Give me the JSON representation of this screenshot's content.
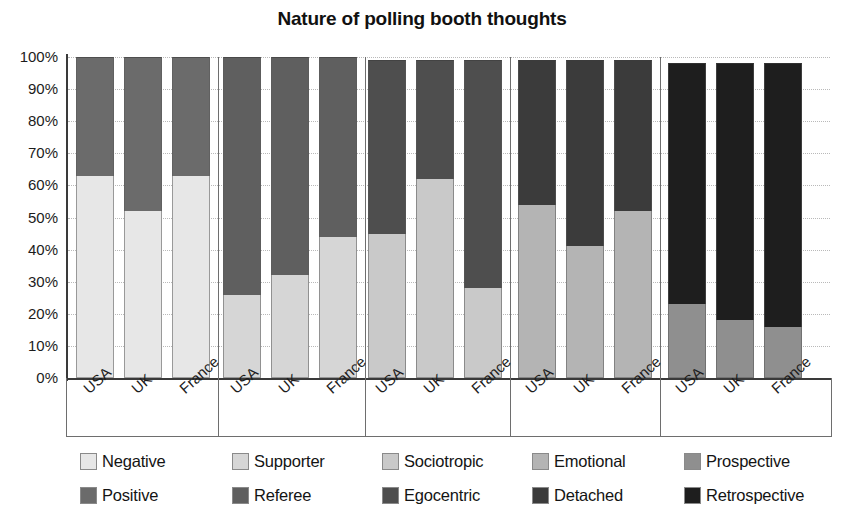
{
  "chart_data": {
    "type": "bar",
    "subtype": "stacked-100-percent-grouped",
    "title": "Nature of polling booth thoughts",
    "xlabel": "",
    "ylabel": "",
    "ylim": [
      0,
      100
    ],
    "ytick_labels": [
      "100%",
      "90%",
      "80%",
      "70%",
      "60%",
      "50%",
      "40%",
      "30%",
      "20%",
      "10%",
      "0%"
    ],
    "ytick_values": [
      100,
      90,
      80,
      70,
      60,
      50,
      40,
      30,
      20,
      10,
      0
    ],
    "grid": true,
    "grid_style": "dotted-horizontal",
    "legend_position": "bottom",
    "categories": [
      "USA",
      "UK",
      "France"
    ],
    "groups": [
      {
        "name": "Negative / Positive",
        "bottom_series": "Negative",
        "top_series": "Positive",
        "bottom_color": "#e7e7e7",
        "top_color": "#6b6b6b",
        "bars": [
          {
            "category": "USA",
            "bottom": 63,
            "top": 37,
            "total": 100
          },
          {
            "category": "UK",
            "bottom": 52,
            "top": 48,
            "total": 100
          },
          {
            "category": "France",
            "bottom": 63,
            "top": 37,
            "total": 100
          }
        ]
      },
      {
        "name": "Supporter / Referee",
        "bottom_series": "Supporter",
        "top_series": "Referee",
        "bottom_color": "#d6d6d6",
        "top_color": "#5f5f5f",
        "bars": [
          {
            "category": "USA",
            "bottom": 26,
            "top": 74,
            "total": 100
          },
          {
            "category": "UK",
            "bottom": 32,
            "top": 68,
            "total": 100
          },
          {
            "category": "France",
            "bottom": 44,
            "top": 56,
            "total": 100
          }
        ]
      },
      {
        "name": "Sociotropic / Egocentric",
        "bottom_series": "Sociotropic",
        "top_series": "Egocentric",
        "bottom_color": "#c9c9c9",
        "top_color": "#4e4e4e",
        "bars": [
          {
            "category": "USA",
            "bottom": 45,
            "top": 54,
            "total": 99
          },
          {
            "category": "UK",
            "bottom": 62,
            "top": 37,
            "total": 99
          },
          {
            "category": "France",
            "bottom": 28,
            "top": 71,
            "total": 99
          }
        ]
      },
      {
        "name": "Emotional / Detached",
        "bottom_series": "Emotional",
        "top_series": "Detached",
        "bottom_color": "#b4b4b4",
        "top_color": "#3b3b3b",
        "bars": [
          {
            "category": "USA",
            "bottom": 54,
            "top": 45,
            "total": 99
          },
          {
            "category": "UK",
            "bottom": 41,
            "top": 58,
            "total": 99
          },
          {
            "category": "France",
            "bottom": 52,
            "top": 47,
            "total": 99
          }
        ]
      },
      {
        "name": "Prospective / Retrospective",
        "bottom_series": "Prospective",
        "top_series": "Retrospective",
        "bottom_color": "#8f8f8f",
        "top_color": "#1e1e1e",
        "bars": [
          {
            "category": "USA",
            "bottom": 23,
            "top": 75,
            "total": 98
          },
          {
            "category": "UK",
            "bottom": 18,
            "top": 80,
            "total": 98
          },
          {
            "category": "France",
            "bottom": 16,
            "top": 82,
            "total": 98
          }
        ]
      }
    ],
    "legend": [
      {
        "label": "Negative",
        "color": "#e7e7e7",
        "row": 0,
        "col": 0
      },
      {
        "label": "Supporter",
        "color": "#d6d6d6",
        "row": 0,
        "col": 1
      },
      {
        "label": "Sociotropic",
        "color": "#c9c9c9",
        "row": 0,
        "col": 2
      },
      {
        "label": "Emotional",
        "color": "#b4b4b4",
        "row": 0,
        "col": 3
      },
      {
        "label": "Prospective",
        "color": "#8f8f8f",
        "row": 0,
        "col": 4
      },
      {
        "label": "Positive",
        "color": "#6b6b6b",
        "row": 1,
        "col": 0
      },
      {
        "label": "Referee",
        "color": "#5f5f5f",
        "row": 1,
        "col": 1
      },
      {
        "label": "Egocentric",
        "color": "#4e4e4e",
        "row": 1,
        "col": 2
      },
      {
        "label": "Detached",
        "color": "#3b3b3b",
        "row": 1,
        "col": 3
      },
      {
        "label": "Retrospective",
        "color": "#1e1e1e",
        "row": 1,
        "col": 4
      }
    ]
  }
}
